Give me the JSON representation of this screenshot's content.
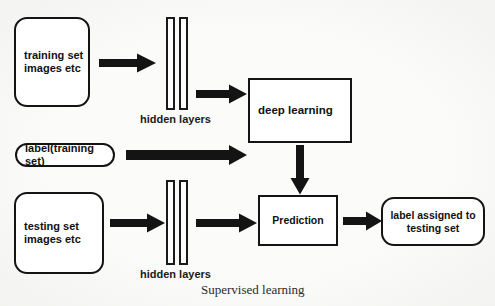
{
  "diagram": {
    "title": "Supervised learning",
    "caption": "Supervised learning",
    "colors": {
      "background": "#fbfbf9",
      "stroke": "#141414",
      "fill": "#ffffff",
      "text": "#111111"
    },
    "nodes": {
      "training_set": {
        "label": "training set\nimages etc",
        "line1": "training set",
        "line2": "images etc",
        "shape": "rounded-rectangle"
      },
      "label_training_set": {
        "label": "label(training set)",
        "shape": "rounded-rectangle"
      },
      "testing_set": {
        "label": "testing set\nimages etc",
        "line1": "testing set",
        "line2": "images etc",
        "shape": "rounded-rectangle"
      },
      "deep_learning": {
        "label": "deep learning",
        "shape": "rectangle"
      },
      "prediction": {
        "label": "Prediction",
        "shape": "rectangle"
      },
      "output_label": {
        "label": "label assigned to\ntesting set",
        "line1": "label assigned to",
        "line2": "testing set",
        "shape": "rounded-rectangle"
      }
    },
    "hidden_layers_top": {
      "label": "hidden layers",
      "bar_count": 2
    },
    "hidden_layers_bottom": {
      "label": "hidden layers",
      "bar_count": 2
    },
    "arrows": [
      {
        "name": "training-set-to-hidden-layers",
        "direction": "right"
      },
      {
        "name": "hidden-layers-to-deep-learning",
        "direction": "right"
      },
      {
        "name": "label-training-set-to-deep-learning",
        "direction": "right"
      },
      {
        "name": "deep-learning-to-prediction",
        "direction": "down"
      },
      {
        "name": "testing-set-to-hidden-layers",
        "direction": "right"
      },
      {
        "name": "hidden-layers-to-prediction",
        "direction": "right"
      },
      {
        "name": "prediction-to-output-label",
        "direction": "right"
      }
    ]
  }
}
